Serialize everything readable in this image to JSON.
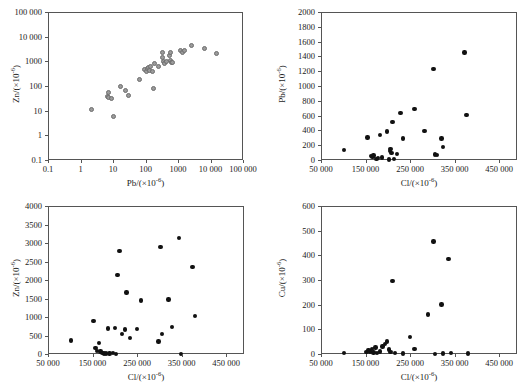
{
  "figure": {
    "title": "",
    "background": "#ffffff",
    "marker_gray": "#9a9a9a",
    "marker_black": "#111111",
    "axis_color": "#555555"
  },
  "chart_data": [
    {
      "id": "panel-a",
      "type": "scatter",
      "title": "",
      "xlabel": "Pb/(×10⁻⁶)",
      "ylabel": "Zn/(×10⁻⁶)",
      "xscale": "log",
      "yscale": "log",
      "xlim": [
        0.1,
        100000
      ],
      "ylim": [
        0.1,
        100000
      ],
      "grid": false,
      "legend": "none",
      "marker_color": "#9a9a9a",
      "xticks": [
        "0.1",
        "1",
        "10",
        "100",
        "1000",
        "10 000",
        "100 000"
      ],
      "xtick_values": [
        0.1,
        1,
        10,
        100,
        1000,
        10000,
        100000
      ],
      "yticks": [
        "0.1",
        "1",
        "10",
        "100",
        "1000",
        "10 000",
        "100 000"
      ],
      "ytick_values": [
        0.1,
        1,
        10,
        100,
        1000,
        10000,
        100000
      ],
      "points": [
        [
          2.0,
          12
        ],
        [
          6.2,
          42
        ],
        [
          6.6,
          38
        ],
        [
          7.0,
          62
        ],
        [
          8.6,
          35
        ],
        [
          9.8,
          6.5
        ],
        [
          16,
          105
        ],
        [
          22,
          72
        ],
        [
          28,
          47
        ],
        [
          62,
          205
        ],
        [
          85,
          520
        ],
        [
          100,
          430
        ],
        [
          105,
          560
        ],
        [
          115,
          640
        ],
        [
          120,
          480
        ],
        [
          135,
          700
        ],
        [
          150,
          420
        ],
        [
          160,
          85
        ],
        [
          175,
          880
        ],
        [
          230,
          700
        ],
        [
          300,
          1500
        ],
        [
          320,
          2500
        ],
        [
          340,
          1100
        ],
        [
          360,
          900
        ],
        [
          400,
          1050
        ],
        [
          520,
          1900
        ],
        [
          540,
          2400
        ],
        [
          560,
          1200
        ],
        [
          600,
          950
        ],
        [
          640,
          1000
        ],
        [
          1100,
          2900
        ],
        [
          1300,
          2600
        ],
        [
          1500,
          3000
        ],
        [
          2400,
          4600
        ],
        [
          6000,
          3500
        ],
        [
          14000,
          2300
        ]
      ]
    },
    {
      "id": "panel-b",
      "type": "scatter",
      "title": "",
      "xlabel": "Cl/(×10⁻⁶)",
      "ylabel": "Pb/(×10⁻⁶)",
      "xscale": "linear",
      "yscale": "linear",
      "xlim": [
        50000,
        490000
      ],
      "ylim": [
        0,
        2000
      ],
      "grid": false,
      "legend": "none",
      "marker_color": "#111111",
      "xticks": [
        "50 000",
        "150 000",
        "250 000",
        "350 000",
        "450 000"
      ],
      "xtick_values": [
        50000,
        150000,
        250000,
        350000,
        450000
      ],
      "yticks": [
        "0",
        "200",
        "400",
        "600",
        "800",
        "1000",
        "1200",
        "1400",
        "1600",
        "1800",
        "2000"
      ],
      "ytick_values": [
        0,
        200,
        400,
        600,
        800,
        1000,
        1200,
        1400,
        1600,
        1800,
        2000
      ],
      "points": [
        [
          100000,
          150
        ],
        [
          152000,
          320
        ],
        [
          160000,
          70
        ],
        [
          163000,
          55
        ],
        [
          166000,
          75
        ],
        [
          172000,
          30
        ],
        [
          176000,
          40
        ],
        [
          180000,
          355
        ],
        [
          184000,
          45
        ],
        [
          196000,
          400
        ],
        [
          200000,
          20
        ],
        [
          202000,
          135
        ],
        [
          204000,
          160
        ],
        [
          206000,
          105
        ],
        [
          208000,
          530
        ],
        [
          212000,
          30
        ],
        [
          218000,
          95
        ],
        [
          226000,
          645
        ],
        [
          232000,
          305
        ],
        [
          258000,
          705
        ],
        [
          280000,
          405
        ],
        [
          300000,
          1245
        ],
        [
          304000,
          90
        ],
        [
          308000,
          85
        ],
        [
          318000,
          305
        ],
        [
          322000,
          190
        ],
        [
          370000,
          1465
        ],
        [
          374000,
          625
        ]
      ]
    },
    {
      "id": "panel-c",
      "type": "scatter",
      "title": "",
      "xlabel": "Cl/(×10⁻⁶)",
      "ylabel": "Zn/(×10⁻⁶)",
      "xscale": "linear",
      "yscale": "linear",
      "xlim": [
        50000,
        490000
      ],
      "ylim": [
        0,
        4000
      ],
      "grid": false,
      "legend": "none",
      "marker_color": "#111111",
      "xticks": [
        "50 000",
        "150 000",
        "250 000",
        "350 000",
        "450 000"
      ],
      "xtick_values": [
        50000,
        150000,
        250000,
        350000,
        450000
      ],
      "yticks": [
        "0",
        "500",
        "1000",
        "1500",
        "2000",
        "2500",
        "3000",
        "3500",
        "4000"
      ],
      "ytick_values": [
        0,
        500,
        1000,
        1500,
        2000,
        2500,
        3000,
        3500,
        4000
      ],
      "points": [
        [
          100000,
          390
        ],
        [
          150000,
          925
        ],
        [
          154000,
          195
        ],
        [
          158000,
          110
        ],
        [
          162000,
          320
        ],
        [
          166000,
          90
        ],
        [
          170000,
          60
        ],
        [
          174000,
          45
        ],
        [
          178000,
          40
        ],
        [
          182000,
          720
        ],
        [
          186000,
          45
        ],
        [
          194000,
          55
        ],
        [
          198000,
          735
        ],
        [
          200000,
          35
        ],
        [
          204000,
          2155
        ],
        [
          208000,
          2810
        ],
        [
          214000,
          560
        ],
        [
          220000,
          690
        ],
        [
          224000,
          1685
        ],
        [
          232000,
          455
        ],
        [
          248000,
          710
        ],
        [
          256000,
          1475
        ],
        [
          296000,
          370
        ],
        [
          300000,
          2920
        ],
        [
          304000,
          565
        ],
        [
          318000,
          1505
        ],
        [
          326000,
          755
        ],
        [
          342000,
          3165
        ],
        [
          346000,
          20
        ],
        [
          372000,
          2385
        ],
        [
          378000,
          1050
        ]
      ]
    },
    {
      "id": "panel-d",
      "type": "scatter",
      "title": "",
      "xlabel": "Cl/(×10⁻⁶)",
      "ylabel": "Cu/(×10⁻⁶)",
      "xscale": "linear",
      "yscale": "linear",
      "xlim": [
        50000,
        490000
      ],
      "ylim": [
        0,
        600
      ],
      "grid": false,
      "legend": "none",
      "marker_color": "#111111",
      "xticks": [
        "50 000",
        "150 000",
        "250 000",
        "350 000",
        "450 000"
      ],
      "xtick_values": [
        50000,
        150000,
        250000,
        350000,
        450000
      ],
      "yticks": [
        "0",
        "100",
        "200",
        "300",
        "400",
        "500",
        "600"
      ],
      "ytick_values": [
        0,
        100,
        200,
        300,
        400,
        500,
        600
      ],
      "points": [
        [
          100000,
          8
        ],
        [
          150000,
          12
        ],
        [
          154000,
          20
        ],
        [
          158000,
          15
        ],
        [
          162000,
          25
        ],
        [
          166000,
          10
        ],
        [
          170000,
          30
        ],
        [
          174000,
          8
        ],
        [
          180000,
          14
        ],
        [
          186000,
          35
        ],
        [
          192000,
          45
        ],
        [
          196000,
          55
        ],
        [
          200000,
          22
        ],
        [
          204000,
          12
        ],
        [
          208000,
          300
        ],
        [
          214000,
          8
        ],
        [
          232000,
          6
        ],
        [
          248000,
          72
        ],
        [
          258000,
          25
        ],
        [
          288000,
          165
        ],
        [
          300000,
          460
        ],
        [
          304000,
          5
        ],
        [
          318000,
          205
        ],
        [
          322000,
          6
        ],
        [
          334000,
          388
        ],
        [
          340000,
          7
        ],
        [
          378000,
          6
        ]
      ]
    }
  ]
}
